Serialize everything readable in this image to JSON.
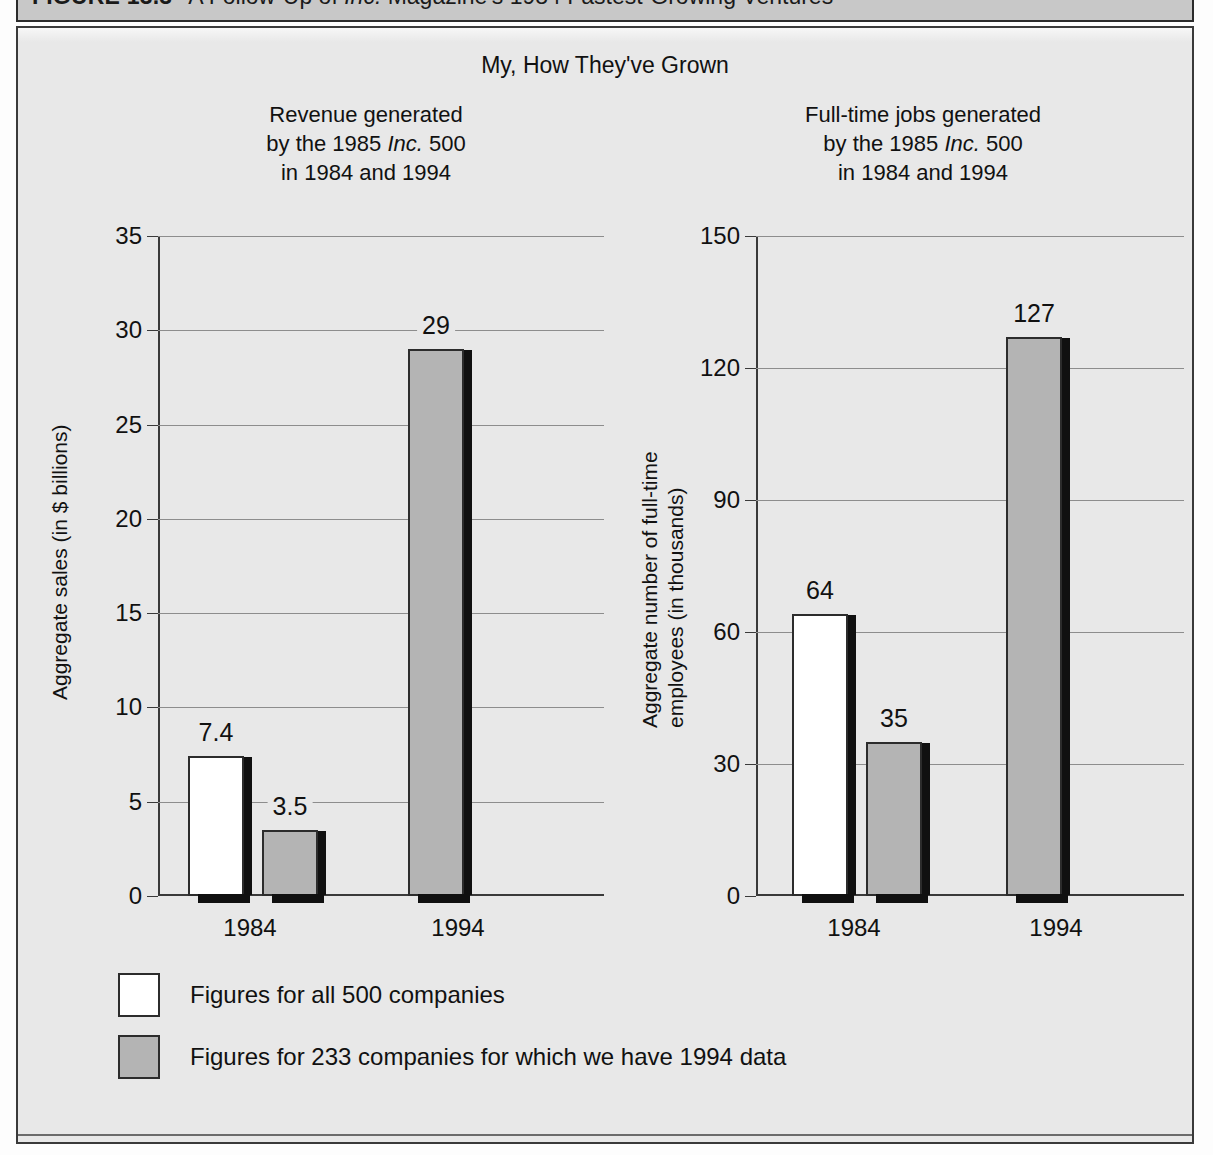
{
  "figure_header": {
    "number": "FIGURE 13.3",
    "caption_before": "A Follow-Up of ",
    "caption_italic": "Inc.",
    "caption_after": " Magazine's 1984 Fastest-Growing Ventures"
  },
  "chart_title": "My, How They've Grown",
  "legend": {
    "items": [
      {
        "swatch": "white",
        "label": "Figures for all 500 companies"
      },
      {
        "swatch": "gray",
        "label": "Figures for 233 companies for which we have 1994 data"
      }
    ]
  },
  "background_text": {
    "left": "product line by formulating a generic strategy for each product line, which supports the business-unit goal of growth and the corporate goal of concentration. Developing a marketing department strategy emphasizing advertising, a production department strategy stressing production with high quality and economies of scale, and an R&D department strategy pursuing innovation to lower product costs, can be derived from the business-unit strategies. For example, a functional strategy of increasing growth in advertising would certainly support the established business-unit goal and the intended differentiation strategy, which in turn would contribute to the organization-wide goal of growth.",
    "right_heading": "Example of Growth Strategies",
    "right": "Consider an organization experiencing a rapid and continuous growth in sales for the past three years. Management realizes that, in time, their production facilities must be expanded. A new plant must be built. Should the facility be designed to increase production for their old line of product, or should they use the new building to expand their product mix? This might involve some form of vertical integration by purchasing either a supplier or a competitor. The course of action they take is a corporate-level strategy.\n\nManagement at the corporate-level should consider several strategic alternatives. An organization can expand its product line by adding variations and new sizes or through increased vertical integration. Several alternatives are possible. If all the options are acceptable, the organization might consider the possible outcomes of each alternative against the corporate-level strategy. For example, if the corporate-level strategy is to grow, then developing a new product line may be a reasonable option.\n\nPerhaps a product development strategy, which introduces new and improved products into existing markets and avoids the need for extensive new investment, may be more attractive. It is also possible that both developing new products and expanding production facilities could be considered."
  },
  "chart_data": [
    {
      "id": "revenue",
      "type": "bar",
      "title": "Revenue generated by the 1985 Inc. 500 in 1984 and 1994",
      "title_lines": [
        "Revenue generated",
        "by the 1985 ",
        "Inc.",
        " 500",
        "in 1984 and 1994"
      ],
      "ylabel": "Aggregate sales (in $ billions)",
      "xlabel": "",
      "categories": [
        "1984",
        "1994"
      ],
      "yticks": [
        0,
        5,
        10,
        15,
        20,
        25,
        30,
        35
      ],
      "ylim": [
        0,
        35
      ],
      "grid": true,
      "series": [
        {
          "name": "Figures for all 500 companies",
          "swatch": "white",
          "values": [
            7.4,
            null
          ],
          "labels": [
            "7.4",
            null
          ]
        },
        {
          "name": "Figures for 233 companies for which we have 1994 data",
          "swatch": "gray",
          "values": [
            3.5,
            29
          ],
          "labels": [
            "3.5",
            "29"
          ]
        }
      ]
    },
    {
      "id": "jobs",
      "type": "bar",
      "title": "Full-time jobs generated by the 1985 Inc. 500 in 1984 and 1994",
      "title_lines": [
        "Full-time jobs generated",
        "by the 1985 ",
        "Inc.",
        " 500",
        "in 1984 and 1994"
      ],
      "ylabel": "Aggregate number of full-time employees (in thousands)",
      "ylabel_lines": [
        "Aggregate number of full-time",
        "employees (in thousands)"
      ],
      "xlabel": "",
      "categories": [
        "1984",
        "1994"
      ],
      "yticks": [
        0,
        30,
        60,
        90,
        120,
        150
      ],
      "ylim": [
        0,
        150
      ],
      "grid": true,
      "series": [
        {
          "name": "Figures for all 500 companies",
          "swatch": "white",
          "values": [
            64,
            null
          ],
          "labels": [
            "64",
            null
          ]
        },
        {
          "name": "Figures for 233 companies for which we have 1994 data",
          "swatch": "gray",
          "values": [
            35,
            127
          ],
          "labels": [
            "35",
            "127"
          ]
        }
      ]
    }
  ]
}
